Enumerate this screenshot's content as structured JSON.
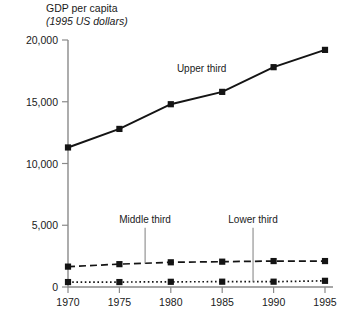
{
  "chart_data": {
    "type": "line",
    "title": "GDP per capita",
    "subtitle": "(1995 US dollars)",
    "xlabel": "",
    "ylabel": "GDP per capita",
    "ylabel_units": "(1995 US dollars)",
    "x": [
      1970,
      1975,
      1980,
      1985,
      1990,
      1995
    ],
    "categories": [
      "1970",
      "1975",
      "1980",
      "1985",
      "1990",
      "1995"
    ],
    "xtick_labels": [
      "1970",
      "1975",
      "1980",
      "1985",
      "1990",
      "1995"
    ],
    "ytick_labels": [
      "0",
      "5,000",
      "10,000",
      "15,000",
      "20,000"
    ],
    "ytick_values": [
      0,
      5000,
      10000,
      15000,
      20000
    ],
    "xlim": [
      1968.5,
      1996.5
    ],
    "ylim": [
      0,
      20000
    ],
    "grid": false,
    "legend": "none",
    "series": [
      {
        "name": "Upper third",
        "style": "solid",
        "marker": "square",
        "color": "#141414",
        "values": [
          11300,
          12800,
          14800,
          15800,
          17800,
          19200
        ]
      },
      {
        "name": "Middle third",
        "style": "dashed",
        "marker": "square",
        "color": "#141414",
        "values": [
          1650,
          1850,
          2000,
          2050,
          2100,
          2100
        ]
      },
      {
        "name": "Lower third",
        "style": "dotted",
        "marker": "square",
        "color": "#141414",
        "values": [
          400,
          400,
          420,
          430,
          430,
          500
        ]
      }
    ],
    "annotations": [
      {
        "label": "Upper third",
        "target_series": "Upper third",
        "x": 1983.0,
        "y": 17400
      },
      {
        "label": "Middle third",
        "target_series": "Middle third",
        "x": 1977.5,
        "y": 5200,
        "leader_to_y": 1900
      },
      {
        "label": "Lower third",
        "target_series": "Lower third",
        "x": 1988.0,
        "y": 5200,
        "leader_to_y": 430
      }
    ]
  },
  "colors": {
    "axis": "#8a8a8a",
    "ink": "#141414",
    "background": "#ffffff"
  }
}
